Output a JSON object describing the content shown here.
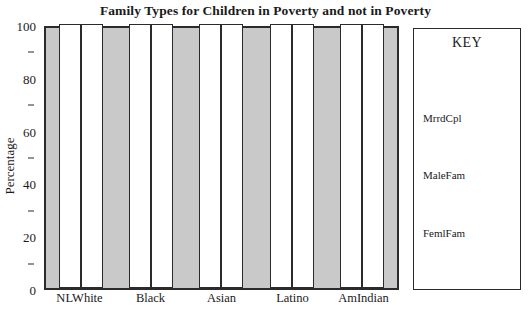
{
  "chart_data": {
    "type": "bar",
    "title": "Family Types for Children in Poverty and not in Poverty",
    "xlabel": "",
    "ylabel": "Percentage",
    "ylim": [
      0,
      100
    ],
    "yticks": [
      0,
      20,
      40,
      60,
      80,
      100
    ],
    "ytick_labels": [
      "0",
      "20",
      "40",
      "60",
      "80",
      "100"
    ],
    "yminor_ticks": [
      10,
      30,
      50,
      70,
      90
    ],
    "grid": false,
    "legend_position": "right",
    "legend_title": "KEY",
    "categories": [
      "NLWhite",
      "Black",
      "Asian",
      "Latino",
      "AmIndian"
    ],
    "series": [
      {
        "name": "MrrdCpl",
        "values": [
          100,
          100,
          100,
          100,
          100
        ]
      },
      {
        "name": "MaleFam",
        "values": [
          100,
          100,
          100,
          100,
          100
        ]
      }
    ],
    "legend_entries": [
      "MrrdCpl",
      "MaleFam",
      "FemlFam"
    ],
    "colors": {
      "plot_background": "#c9c9c9",
      "bar_fill": "#ffffff",
      "bar_edge": "#2b2b2b",
      "frame": "#2b2b2b",
      "text": "#1a1a1a",
      "page_background": "#ffffff"
    }
  }
}
